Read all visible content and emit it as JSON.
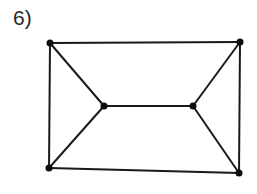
{
  "figure": {
    "label": "6)"
  },
  "graph": {
    "edge_color": "#1a1a1a",
    "vertex_color": "#0d0d0d",
    "edge_width": 2,
    "vertex_radius": 3.5,
    "vertices": [
      {
        "id": "top-left",
        "x": 50,
        "y": 43
      },
      {
        "id": "top-right",
        "x": 240,
        "y": 42
      },
      {
        "id": "inner-left",
        "x": 104,
        "y": 106
      },
      {
        "id": "inner-right",
        "x": 193,
        "y": 106
      },
      {
        "id": "bottom-left",
        "x": 49,
        "y": 168
      },
      {
        "id": "bottom-right",
        "x": 239,
        "y": 173
      }
    ],
    "edges": [
      [
        "top-left",
        "top-right"
      ],
      [
        "top-left",
        "bottom-left"
      ],
      [
        "top-right",
        "bottom-right"
      ],
      [
        "bottom-left",
        "bottom-right"
      ],
      [
        "top-left",
        "inner-left"
      ],
      [
        "bottom-left",
        "inner-left"
      ],
      [
        "top-right",
        "inner-right"
      ],
      [
        "bottom-right",
        "inner-right"
      ],
      [
        "inner-left",
        "inner-right"
      ]
    ]
  }
}
